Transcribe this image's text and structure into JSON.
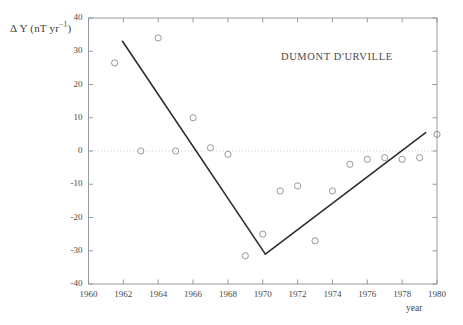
{
  "figure": {
    "title": "DUMONT D'URVILLE",
    "ylabel_main": "Δ Y (nT yr",
    "ylabel_sup": "−1",
    "ylabel_close": ")",
    "xlabel": "year"
  },
  "chart_data": {
    "type": "scatter",
    "title": "DUMONT D'URVILLE",
    "xlabel": "year",
    "ylabel": "Δ Y (nT yr⁻¹)",
    "xlim": [
      1960,
      1980
    ],
    "ylim": [
      -40,
      40
    ],
    "xticks": [
      1960,
      1962,
      1964,
      1966,
      1968,
      1970,
      1972,
      1974,
      1976,
      1978,
      1980
    ],
    "yticks": [
      -40,
      -30,
      -20,
      -10,
      0,
      10,
      20,
      30,
      40
    ],
    "xtick_labels": [
      "1960",
      "1962",
      "1964",
      "1966",
      "1968",
      "1970",
      "1972",
      "1974",
      "1976",
      "1978",
      "1980"
    ],
    "ytick_labels": [
      "-40",
      "-30",
      "-20",
      "-10",
      "0",
      "10",
      "20",
      "30",
      "40"
    ],
    "grid": false,
    "zero_line": {
      "y": 0,
      "style": "dotted",
      "color": "#b9b9c8"
    },
    "marker": {
      "shape": "circle-open",
      "size": 3.1,
      "color": "#8a8a96"
    },
    "legend": null,
    "points": [
      {
        "x": 1961.5,
        "y": 26.5
      },
      {
        "x": 1963.0,
        "y": 0.0
      },
      {
        "x": 1964.0,
        "y": 34.0
      },
      {
        "x": 1965.0,
        "y": 0.0
      },
      {
        "x": 1966.0,
        "y": 10.0
      },
      {
        "x": 1967.0,
        "y": 1.0
      },
      {
        "x": 1968.0,
        "y": -1.0
      },
      {
        "x": 1969.0,
        "y": -31.5
      },
      {
        "x": 1970.0,
        "y": -25.0
      },
      {
        "x": 1971.0,
        "y": -12.0
      },
      {
        "x": 1972.0,
        "y": -10.5
      },
      {
        "x": 1973.0,
        "y": -27.0
      },
      {
        "x": 1974.0,
        "y": -12.0
      },
      {
        "x": 1975.0,
        "y": -4.0
      },
      {
        "x": 1976.0,
        "y": -2.5
      },
      {
        "x": 1977.0,
        "y": -2.0
      },
      {
        "x": 1978.0,
        "y": -2.5
      },
      {
        "x": 1979.0,
        "y": -2.0
      },
      {
        "x": 1980.0,
        "y": 5.0
      }
    ],
    "trend_lines": [
      {
        "name": "descending-trend",
        "x0": 1961.95,
        "y0": 33.0,
        "x1": 1970.15,
        "y1": -31.0,
        "color": "#2e2e2e",
        "width": 1.6
      },
      {
        "name": "ascending-trend",
        "x0": 1970.15,
        "y0": -31.0,
        "x1": 1979.35,
        "y1": 5.5,
        "color": "#2e2e2e",
        "width": 1.6
      }
    ]
  }
}
